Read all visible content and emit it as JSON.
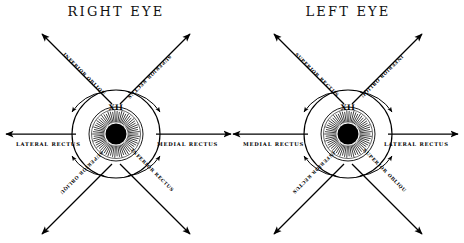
{
  "figure": {
    "background_color": "#ffffff",
    "ink_color": "#000000",
    "panel_count": 2
  },
  "panels": [
    {
      "id": "right-eye",
      "title": "RIGHT  EYE",
      "nerve_label": "XII",
      "labels": {
        "upper_left": "INFERIOR OBLIQUE",
        "upper_right": "SUPERIOR RECTUS",
        "left": "LATERAL RECTUS",
        "right": "MEDIAL RECTUS",
        "lower_left": "SUPERIOR OBLIQUE",
        "lower_right": "INFERIOR RECTUS"
      }
    },
    {
      "id": "left-eye",
      "title": "LEFT  EYE",
      "nerve_label": "XII",
      "labels": {
        "upper_left": "SUPERIOR RECTUS",
        "upper_right": "INFERIOR OBLIQUE",
        "left": "MEDIAL RECTUS",
        "right": "LATERAL RECTUS",
        "lower_left": "INFERIOR RECTUS",
        "lower_right": "SUPERIOR OBLIQUE"
      }
    }
  ]
}
